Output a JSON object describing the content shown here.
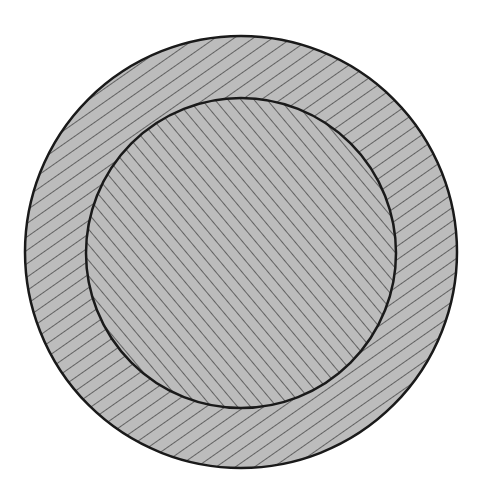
{
  "figure": {
    "width": 481,
    "height": 495,
    "background": "#ffffff",
    "outer_circle": {
      "cx": 241,
      "cy": 252,
      "r": 216,
      "fill": "#bcbcbc",
      "stroke": "#1a1a1a",
      "stroke_width": 2.5,
      "hatch": {
        "angle": 55,
        "spacing": 11,
        "color": "#4a4a4a",
        "width": 1.6
      }
    },
    "inner_circle": {
      "cx": 241,
      "cy": 253,
      "r": 155,
      "fill": "#bcbcbc",
      "stroke": "#1a1a1a",
      "stroke_width": 2.5,
      "hatch": {
        "angle": -40,
        "spacing": 10,
        "color": "#4a4a4a",
        "width": 1.6
      }
    }
  }
}
